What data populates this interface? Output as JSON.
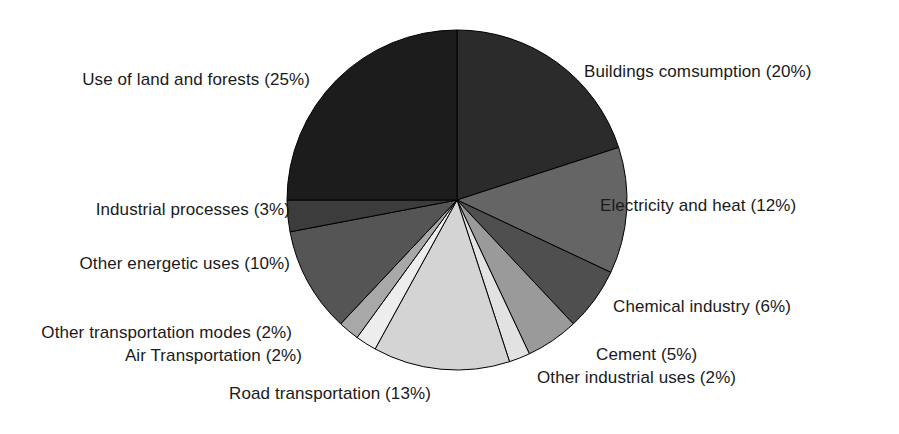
{
  "chart_data": {
    "type": "pie",
    "title": "",
    "subtitle": "",
    "xlabel": "",
    "ylabel": "",
    "legend_position": "none",
    "grid": false,
    "start_angle_deg": 0,
    "direction": "clockwise",
    "units": "percent",
    "categories": [
      "Buildings comsumption",
      "Electricity and heat",
      "Chemical industry",
      "Cement",
      "Other industrial uses",
      "Road transportation",
      "Air Transportation",
      "Other transportation modes",
      "Other energetic uses",
      "Industrial processes",
      "Use of land and forests"
    ],
    "values": [
      20,
      12,
      6,
      5,
      2,
      13,
      2,
      2,
      10,
      3,
      25
    ],
    "slices": [
      {
        "label": "Buildings comsumption",
        "value": 20,
        "text": "Buildings comsumption (20%)",
        "color": "#2b2b2b"
      },
      {
        "label": "Electricity and heat",
        "value": 12,
        "text": "Electricity and heat (12%)",
        "color": "#656565"
      },
      {
        "label": "Chemical industry",
        "value": 6,
        "text": "Chemical industry (6%)",
        "color": "#4f4f4f"
      },
      {
        "label": "Cement",
        "value": 5,
        "text": "Cement (5%)",
        "color": "#9a9a9a"
      },
      {
        "label": "Other industrial uses",
        "value": 2,
        "text": "Other industrial uses (2%)",
        "color": "#e2e2e2"
      },
      {
        "label": "Road transportation",
        "value": 13,
        "text": "Road transportation (13%)",
        "color": "#d4d4d4"
      },
      {
        "label": "Air Transportation",
        "value": 2,
        "text": "Air Transportation (2%)",
        "color": "#ededed"
      },
      {
        "label": "Other transportation modes",
        "value": 2,
        "text": "Other transportation modes (2%)",
        "color": "#a8a8a8"
      },
      {
        "label": "Other energetic uses",
        "value": 10,
        "text": "Other energetic uses (10%)",
        "color": "#555555"
      },
      {
        "label": "Industrial processes",
        "value": 3,
        "text": "Industrial processes (3%)",
        "color": "#3c3c3c"
      },
      {
        "label": "Use of land and forests",
        "value": 25,
        "text": "Use of land and forests (25%)",
        "color": "#1c1c1c"
      }
    ],
    "labels": [
      "Use of land and forests (25%)",
      "Buildings comsumption (20%)",
      "Electricity and heat (12%)",
      "Industrial processes (3%)",
      "Other energetic uses (10%)",
      "Chemical industry (6%)",
      "Other transportation modes (2%)",
      "Air Transportation (2%)",
      "Cement (5%)",
      "Other industrial uses (2%)",
      "Road transportation (13%)"
    ],
    "total": 100
  },
  "figure": {
    "background": "#ffffff",
    "outline_color": "#000000",
    "text_color": "#1a1a1a"
  }
}
